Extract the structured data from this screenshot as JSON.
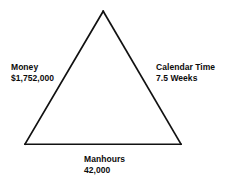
{
  "diagram": {
    "type": "project-management-triangle",
    "background_color": "#ffffff",
    "stroke_color": "#111111",
    "text_color": "#0b0b0b",
    "vertices": {
      "apex": [
        103,
        11
      ],
      "bottom_left": [
        25,
        144
      ],
      "bottom_right": [
        181,
        144
      ]
    },
    "labels": {
      "left": {
        "title": "Money",
        "value": "$1,752,000"
      },
      "right": {
        "title": "Calendar Time",
        "value": "7.5 Weeks"
      },
      "bottom": {
        "title": "Manhours",
        "value": "42,000"
      }
    }
  }
}
